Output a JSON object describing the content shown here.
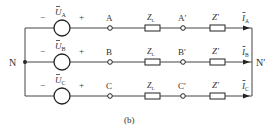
{
  "figure": {
    "caption": "(b)",
    "left_node": "N",
    "right_node": "N′",
    "colors": {
      "line": "#444444",
      "text": "#333333",
      "background": "#ffffff"
    },
    "phases": [
      {
        "source_label": "U",
        "source_sub": "A",
        "minus": "−",
        "plus": "+",
        "terminal": "A",
        "line_impedance": "Z",
        "line_impedance_sub": "L",
        "load_terminal": "A′",
        "load_impedance": "Z′",
        "current_label": "I",
        "current_sub": "A"
      },
      {
        "source_label": "U",
        "source_sub": "B",
        "minus": "−",
        "plus": "+",
        "terminal": "B",
        "line_impedance": "Z",
        "line_impedance_sub": "L",
        "load_terminal": "B′",
        "load_impedance": "Z′",
        "current_label": "I",
        "current_sub": "B"
      },
      {
        "source_label": "U",
        "source_sub": "C",
        "minus": "−",
        "plus": "+",
        "terminal": "C",
        "line_impedance": "Z",
        "line_impedance_sub": "L",
        "load_terminal": "C′",
        "load_impedance": "Z′",
        "current_label": "I",
        "current_sub": "C"
      }
    ]
  }
}
